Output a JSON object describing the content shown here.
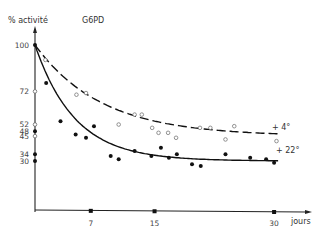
{
  "chart_data": {
    "type": "scatter",
    "title": "G6PD",
    "ylabel": "% activité",
    "xlabel": "jours",
    "xlim": [
      0,
      31
    ],
    "ylim": [
      0,
      105
    ],
    "grid": false,
    "x_ticks": [
      7,
      15,
      30
    ],
    "y_ticks": [
      100,
      72,
      52,
      48,
      45,
      34,
      30
    ],
    "y_tick_markers": [
      {
        "value": 100,
        "filled": true
      },
      {
        "value": 72,
        "filled": false
      },
      {
        "value": 52,
        "filled": false
      },
      {
        "value": 48,
        "filled": true
      },
      {
        "value": 45,
        "filled": false
      },
      {
        "value": 34,
        "filled": true
      },
      {
        "value": 30,
        "filled": true
      }
    ],
    "series": [
      {
        "name": "+ 4°",
        "marker": "open-circle",
        "fit_line": "dashed",
        "fit_curve": {
          "plateau": 45,
          "start": 100,
          "rate": 0.12
        },
        "points": [
          [
            1.3,
            91
          ],
          [
            5.2,
            70
          ],
          [
            6.4,
            71
          ],
          [
            10.5,
            52
          ],
          [
            12.5,
            58
          ],
          [
            13.4,
            58
          ],
          [
            14.7,
            50
          ],
          [
            15.5,
            47
          ],
          [
            16.7,
            47
          ],
          [
            17.7,
            44
          ],
          [
            20.7,
            50
          ],
          [
            22,
            50
          ],
          [
            23.9,
            43
          ],
          [
            25,
            51
          ],
          [
            30.3,
            42
          ]
        ]
      },
      {
        "name": "+ 22°",
        "marker": "filled-circle",
        "fit_line": "solid",
        "fit_curve": {
          "plateau": 30,
          "start": 100,
          "rate": 0.2
        },
        "points": [
          [
            1.4,
            77
          ],
          [
            3.2,
            54
          ],
          [
            5.1,
            46
          ],
          [
            6.4,
            44
          ],
          [
            7.4,
            51
          ],
          [
            9.5,
            33
          ],
          [
            10.5,
            31
          ],
          [
            12.5,
            36
          ],
          [
            14.6,
            33
          ],
          [
            15.8,
            38
          ],
          [
            16.8,
            32
          ],
          [
            17.8,
            34
          ],
          [
            19.7,
            28
          ],
          [
            20.8,
            27
          ],
          [
            23.9,
            34
          ],
          [
            27,
            32
          ],
          [
            29,
            31
          ],
          [
            30,
            29
          ]
        ]
      }
    ],
    "annotations": [
      {
        "text": "+ 4°",
        "series": 0
      },
      {
        "text": "+ 22°",
        "series": 1
      }
    ]
  }
}
